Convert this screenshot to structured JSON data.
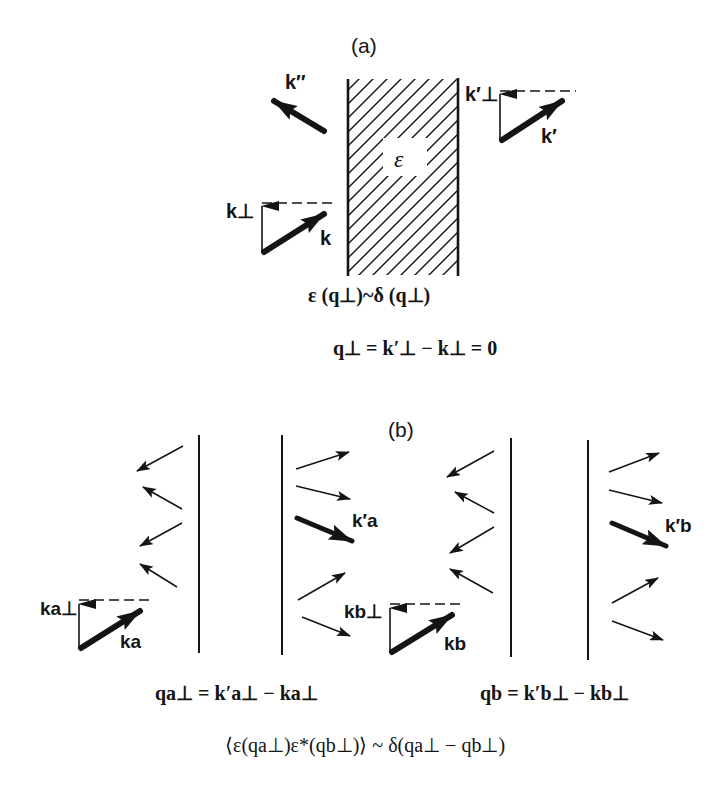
{
  "figure": {
    "panel_a": {
      "label": "(a)",
      "medium_symbol": "ε",
      "vectors": {
        "reflected": "k″",
        "incident": "k",
        "incident_perp": "k⊥",
        "transmitted": "k′",
        "transmitted_perp": "k′⊥"
      },
      "equation_1": {
        "text": "ε (q⊥)~δ (q⊥)"
      },
      "equation_2": {
        "text": "q⊥ = k′⊥ − k⊥ = 0"
      }
    },
    "panel_b": {
      "label": "(b)",
      "left_slab": {
        "incident": "ka",
        "incident_perp": "ka⊥",
        "transmitted": "k′a",
        "equation": "qa⊥ = k′a⊥ − ka⊥"
      },
      "right_slab": {
        "incident": "kb",
        "incident_perp": "kb⊥",
        "transmitted": "k′b",
        "equation": "qb = k′b⊥ − kb⊥"
      },
      "correlation": "⟨ε(qa⊥)ε*(qb⊥)⟩ ~ δ(qa⊥ − qb⊥)"
    },
    "colors": {
      "ink": "#141414",
      "background": "#ffffff"
    }
  }
}
